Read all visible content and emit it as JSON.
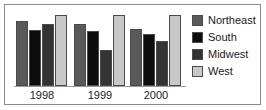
{
  "figure": {
    "name": "regional-bar-chart",
    "background": "#ffffff",
    "border_color": "#8a8a8a"
  },
  "chart_data": {
    "type": "bar",
    "title": "",
    "subtitle": "",
    "xlabel": "",
    "ylabel": "",
    "categories": [
      "1998",
      "1999",
      "2000"
    ],
    "series": [
      {
        "name": "Northeast",
        "color": "#595959",
        "values": [
          75,
          71,
          66
        ]
      },
      {
        "name": "South",
        "color": "#0d0d0d",
        "values": [
          65,
          63,
          60
        ]
      },
      {
        "name": "Midwest",
        "color": "#333333",
        "values": [
          72,
          42,
          52
        ]
      },
      {
        "name": "West",
        "color": "#c8c8c8",
        "values": [
          82,
          82,
          82
        ]
      }
    ],
    "ylim": [
      0,
      90
    ],
    "grid": false,
    "legend_position": "right",
    "axis_line_color": "#9a9a9a",
    "bar_outline_color": "#4a4a4a"
  },
  "legend": {
    "items": [
      {
        "label": "Northeast",
        "color": "#595959"
      },
      {
        "label": "South",
        "color": "#0d0d0d"
      },
      {
        "label": "Midwest",
        "color": "#333333"
      },
      {
        "label": "West",
        "color": "#c8c8c8"
      }
    ]
  },
  "axis": {
    "tick_labels": [
      "1998",
      "1999",
      "2000"
    ]
  }
}
